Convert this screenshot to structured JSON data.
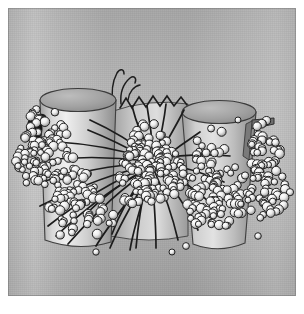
{
  "figure": {
    "domain": "scientific-illustration",
    "title": "",
    "caption": "",
    "medium": "halftone grayscale rendering",
    "background_color": "#b9b9b9",
    "plate_margin_color": "#ffffff",
    "ink_color": "#1a1a1a",
    "sphere_fill": "#f2f2f2",
    "sphere_shade": "#8f8f8f",
    "cylinder_fill": "#d6d6d6",
    "cylinder_shade": "#9a9a9a",
    "cylinder_cap": "#a7a7a7"
  },
  "objects": {
    "cylinder_left": {
      "name": "left-cylinder",
      "cx": 78,
      "top_y": 100,
      "bottom_y": 248,
      "rx_top": 38,
      "ry_top": 11,
      "rx_bottom": 33,
      "label": ""
    },
    "cylinder_right": {
      "name": "right-cylinder",
      "cx": 219,
      "top_y": 112,
      "bottom_y": 252,
      "rx_top": 37,
      "ry_top": 11,
      "rx_bottom": 26,
      "label": ""
    },
    "cylinder_back": {
      "name": "background-cylinder",
      "x": 110,
      "y": 108,
      "w": 78,
      "h": 132,
      "label": ""
    },
    "flange_right": {
      "name": "right-flange",
      "x": 245,
      "y": 118,
      "w": 28,
      "h": 10,
      "label": ""
    },
    "core_cluster": {
      "name": "central-sphere-cluster",
      "cx": 150,
      "cy": 168,
      "rx": 33,
      "ry": 40,
      "sphere_count": 150
    },
    "clusters": [
      {
        "name": "left-sphere-cluster",
        "cx": 48,
        "cy": 150,
        "rx": 30,
        "ry": 42,
        "count": 95
      },
      {
        "name": "left-lower-cluster",
        "cx": 80,
        "cy": 205,
        "rx": 34,
        "ry": 34,
        "count": 70
      },
      {
        "name": "right-inner-cluster",
        "cx": 213,
        "cy": 185,
        "rx": 30,
        "ry": 52,
        "count": 110
      },
      {
        "name": "right-outer-cluster",
        "cx": 266,
        "cy": 175,
        "rx": 22,
        "ry": 48,
        "count": 85
      }
    ],
    "filaments": {
      "name": "radiating-filaments",
      "origin_x": 150,
      "origin_y": 168,
      "count": 26,
      "stroke_width": 1.6,
      "description": "dark curved strands radiating from the central cluster, fanning down-left and down-right"
    },
    "zigzag": {
      "name": "zigzag-strand",
      "x1": 122,
      "y1": 104,
      "x2": 188,
      "y2": 100,
      "peaks": 9,
      "description": "saw-tooth strand across the top of the background cylinder"
    },
    "hook_strands": {
      "name": "hook-strands-top",
      "x": 112,
      "y": 72,
      "description": "two thin strands hooking upward above the cluster"
    },
    "dark_blob": {
      "name": "dark-blob-left",
      "cx": 36,
      "cy": 128,
      "rx": 6,
      "ry": 9
    }
  },
  "annotations": {
    "items": []
  }
}
